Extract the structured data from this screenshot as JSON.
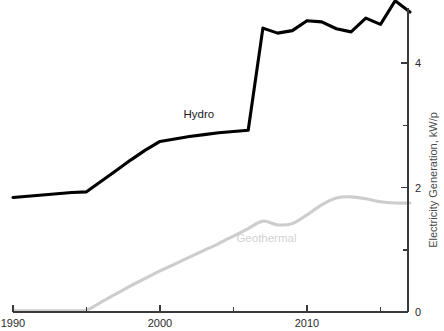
{
  "chart_data": {
    "type": "line",
    "title": "",
    "subtitle": "",
    "xlabel": "",
    "ylabel": "Electricity Generation, kW/p",
    "ylabel_position": "right",
    "xlim": [
      1989,
      2017.8
    ],
    "ylim": [
      -0.05,
      5.35
    ],
    "grid": false,
    "legend": "inline-annotations",
    "x_major_ticks": [
      1990,
      2000,
      2010
    ],
    "x_major_tick_labels": [
      "1990",
      "2000",
      "2010"
    ],
    "x_minor_ticks": [
      1995,
      2005,
      2015
    ],
    "y_major_ticks": [
      0,
      2,
      4
    ],
    "y_major_tick_labels": [
      "0",
      "2",
      "4"
    ],
    "y_minor_ticks": [
      1,
      3,
      5
    ],
    "x": [
      1990,
      1991,
      1992,
      1993,
      1994,
      1995,
      1996,
      1997,
      1998,
      1999,
      2000,
      2001,
      2002,
      2003,
      2004,
      2005,
      2006,
      2007,
      2008,
      2009,
      2010,
      2011,
      2012,
      2013,
      2014,
      2015,
      2016,
      2017
    ],
    "series": [
      {
        "name": "Hydro",
        "color": "#000000",
        "label_x": 2001.6,
        "label_y": 3.12,
        "values": [
          1.84,
          1.86,
          1.88,
          1.9,
          1.92,
          1.93,
          2.1,
          2.27,
          2.44,
          2.6,
          2.74,
          2.78,
          2.82,
          2.85,
          2.88,
          2.9,
          2.92,
          4.56,
          4.48,
          4.52,
          4.68,
          4.66,
          4.55,
          4.5,
          4.72,
          4.62,
          5.0,
          4.82
        ]
      },
      {
        "name": "Geothermal",
        "color": "#cdcdcd",
        "label_x": 2005.2,
        "label_y": 1.12,
        "values": [
          0.02,
          0.02,
          0.02,
          0.02,
          0.02,
          0.03,
          0.16,
          0.29,
          0.42,
          0.54,
          0.66,
          0.77,
          0.88,
          0.99,
          1.1,
          1.22,
          1.34,
          1.46,
          1.4,
          1.42,
          1.56,
          1.72,
          1.83,
          1.85,
          1.82,
          1.77,
          1.75,
          1.75
        ]
      }
    ]
  },
  "axes": {
    "y_axis_title": "Electricity Generation, kW/p",
    "y_tick_labels": [
      "4",
      "2",
      "0"
    ],
    "x_tick_labels": [
      "1990",
      "2000",
      "2010"
    ]
  },
  "annotations": {
    "hydro_label": "Hydro",
    "geothermal_label": "Geothermal"
  },
  "colors": {
    "hydro": "#000000",
    "geothermal": "#cdcdcd",
    "axis": "#3a3a3a",
    "tick_text": "#2b2b2b",
    "axis_title": "#4a4a4a",
    "background": "#ffffff"
  }
}
